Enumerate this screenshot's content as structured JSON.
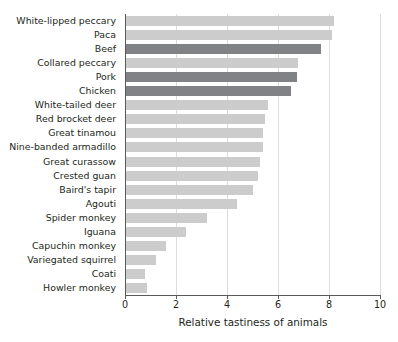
{
  "chart_data": {
    "type": "bar",
    "orientation": "horizontal",
    "title": "",
    "xlabel": "Relative tastiness of animals",
    "ylabel": "",
    "xlim": [
      0,
      10
    ],
    "xticks": [
      0,
      2,
      4,
      6,
      8,
      10
    ],
    "xtick_labels": [
      "0",
      "2",
      "4",
      "6",
      "8",
      "10"
    ],
    "grid": "vertical",
    "legend": "none",
    "colors": {
      "wild": "#cccccc",
      "domestic": "#808285",
      "axis": "#58595b",
      "grid": "#dcdcdc",
      "text": "#231f20",
      "background": "#ffffff"
    },
    "categories": [
      "White-lipped peccary",
      "Paca",
      "Beef",
      "Collared peccary",
      "Pork",
      "Chicken",
      "White-tailed deer",
      "Red brocket deer",
      "Great tinamou",
      "Nine-banded armadillo",
      "Great curassow",
      "Crested guan",
      "Baird's tapir",
      "Agouti",
      "Spider monkey",
      "Iguana",
      "Capuchin monkey",
      "Variegated squirrel",
      "Coati",
      "Howler monkey"
    ],
    "values": [
      8.2,
      8.1,
      7.7,
      6.8,
      6.75,
      6.5,
      5.6,
      5.5,
      5.4,
      5.4,
      5.3,
      5.2,
      5.0,
      4.4,
      3.2,
      2.4,
      1.6,
      1.2,
      0.8,
      0.85
    ],
    "groups": [
      "wild",
      "wild",
      "domestic",
      "wild",
      "domestic",
      "domestic",
      "wild",
      "wild",
      "wild",
      "wild",
      "wild",
      "wild",
      "wild",
      "wild",
      "wild",
      "wild",
      "wild",
      "wild",
      "wild",
      "wild"
    ]
  }
}
